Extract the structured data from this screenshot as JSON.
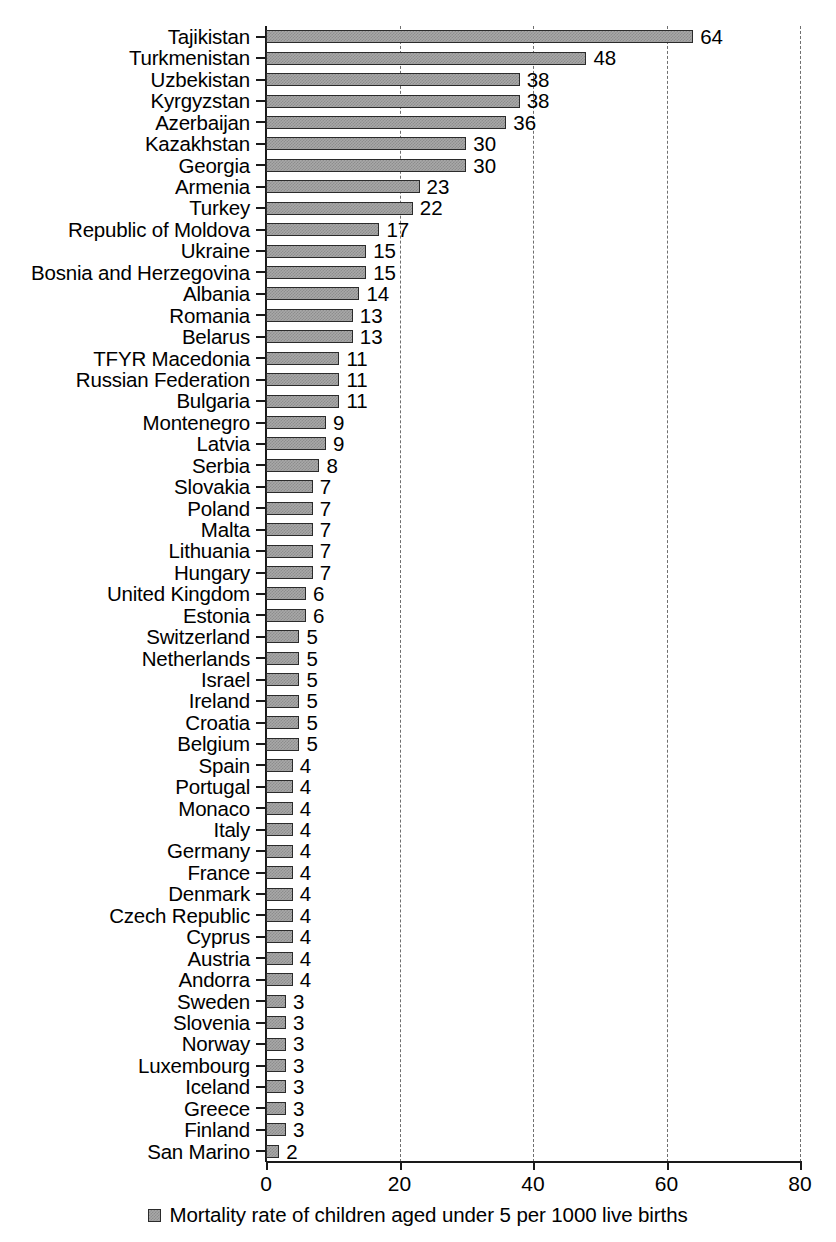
{
  "chart_data": {
    "type": "bar",
    "orientation": "horizontal",
    "title": "",
    "subtitle": "",
    "xlabel": "",
    "ylabel": "",
    "xlim": [
      0,
      80
    ],
    "xticks": [
      "0",
      "20",
      "40",
      "60",
      "80"
    ],
    "xtick_values": [
      0,
      20,
      40,
      60,
      80
    ],
    "grid": "vertical-dashed",
    "legend_position": "bottom-center",
    "legend": [
      "Mortality rate of children aged under 5 per 1000 live births"
    ],
    "series": [
      {
        "name": "Mortality rate of children aged under 5 per 1000 live births",
        "values": [
          64,
          48,
          38,
          38,
          36,
          30,
          30,
          23,
          22,
          17,
          15,
          15,
          14,
          13,
          13,
          11,
          11,
          11,
          9,
          9,
          8,
          7,
          7,
          7,
          7,
          7,
          6,
          6,
          5,
          5,
          5,
          5,
          5,
          5,
          4,
          4,
          4,
          4,
          4,
          4,
          4,
          4,
          4,
          4,
          4,
          3,
          3,
          3,
          3,
          3,
          3,
          3,
          2
        ]
      }
    ],
    "categories": [
      "Tajikistan",
      "Turkmenistan",
      "Uzbekistan",
      "Kyrgyzstan",
      "Azerbaijan",
      "Kazakhstan",
      "Georgia",
      "Armenia",
      "Turkey",
      "Republic of Moldova",
      "Ukraine",
      "Bosnia and Herzegovina",
      "Albania",
      "Romania",
      "Belarus",
      "TFYR Macedonia",
      "Russian Federation",
      "Bulgaria",
      "Montenegro",
      "Latvia",
      "Serbia",
      "Slovakia",
      "Poland",
      "Malta",
      "Lithuania",
      "Hungary",
      "United Kingdom",
      "Estonia",
      "Switzerland",
      "Netherlands",
      "Israel",
      "Ireland",
      "Croatia",
      "Belgium",
      "Spain",
      "Portugal",
      "Monaco",
      "Italy",
      "Germany",
      "France",
      "Denmark",
      "Czech Republic",
      "Cyprus",
      "Austria",
      "Andorra",
      "Sweden",
      "Slovenia",
      "Norway",
      "Luxembourg",
      "Iceland",
      "Greece",
      "Finland",
      "San Marino"
    ],
    "data_labels": [
      "64",
      "48",
      "38",
      "38",
      "36",
      "30",
      "30",
      "23",
      "22",
      "17",
      "15",
      "15",
      "14",
      "13",
      "13",
      "11",
      "11",
      "11",
      "9",
      "9",
      "8",
      "7",
      "7",
      "7",
      "7",
      "7",
      "6",
      "6",
      "5",
      "5",
      "5",
      "5",
      "5",
      "5",
      "4",
      "4",
      "4",
      "4",
      "4",
      "4",
      "4",
      "4",
      "4",
      "4",
      "4",
      "3",
      "3",
      "3",
      "3",
      "3",
      "3",
      "3",
      "2"
    ],
    "colors": {
      "bar_fill": "#a8a8a8",
      "bar_pattern": "#8d8d8d",
      "bar_border": "#2b2b2b",
      "axis": "#1a1a1a",
      "gridline": "#6f6f6f",
      "background": "#ffffff",
      "text": "#000000"
    }
  }
}
